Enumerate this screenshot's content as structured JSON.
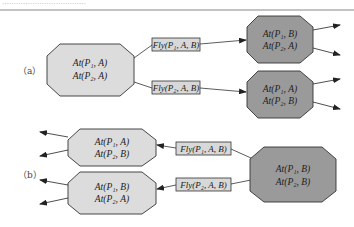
{
  "header": {
    "truncated_text": "………………………………",
    "rule": true
  },
  "colors": {
    "light_state_fill": "#dcdcdc",
    "dark_state_fill": "#9a9a9a",
    "action_fill": "#d8d8d8",
    "stroke": "#333333"
  },
  "part_a": {
    "label": "（a）",
    "initial_state": {
      "line1": "At(P₁, A)",
      "line2": "At(P₂, A)"
    },
    "actions": [
      {
        "label": "Fly(P₁, A, B)"
      },
      {
        "label": "Fly(P₂, A, B)"
      }
    ],
    "result_states": [
      {
        "line1": "At(P₁, B)",
        "line2": "At(P₂, A)"
      },
      {
        "line1": "At(P₁, A)",
        "line2": "At(P₂, B)"
      }
    ]
  },
  "part_b": {
    "label": "（b）",
    "goal_state": {
      "line1": "At(P₁, B)",
      "line2": "At(P₂, B)"
    },
    "actions": [
      {
        "label": "Fly(P₁, A, B)"
      },
      {
        "label": "Fly(P₂, A, B)"
      }
    ],
    "predecessor_states": [
      {
        "line1": "At(P₁, A)",
        "line2": "At(P₂, B)"
      },
      {
        "line1": "At(P₁, B)",
        "line2": "At(P₂, A)"
      }
    ]
  }
}
